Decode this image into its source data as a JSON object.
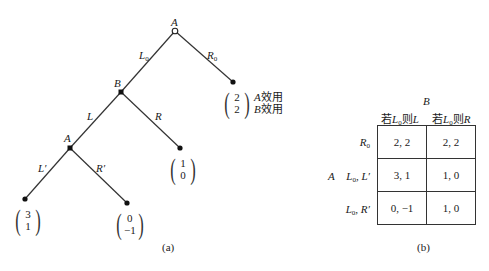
{
  "figure_a": {
    "caption": "(a)",
    "nodes": {
      "root": {
        "player": "A",
        "type": "open"
      },
      "b": {
        "player": "B"
      },
      "a2": {
        "player": "A"
      }
    },
    "edges": {
      "l0": {
        "label": "L",
        "sub": "0"
      },
      "r0": {
        "label": "R",
        "sub": "0"
      },
      "l": {
        "label": "L"
      },
      "r": {
        "label": "R"
      },
      "lp": {
        "label": "L′"
      },
      "rp": {
        "label": "R′"
      }
    },
    "payoffs": {
      "r0": {
        "a": "2",
        "b": "2"
      },
      "r": {
        "a": "1",
        "b": "0"
      },
      "lp": {
        "a": "3",
        "b": "1"
      },
      "rp": {
        "a": "0",
        "b": "−1"
      }
    },
    "legend": {
      "a_player": "A",
      "a_text": "效用",
      "b_player": "B",
      "b_text": "效用"
    }
  },
  "figure_b": {
    "caption": "(b)",
    "column_player": "B",
    "row_player": "A",
    "columns": [
      {
        "pre": "若",
        "cond": "L",
        "cond_sub": "0",
        "mid": "则",
        "act": "L"
      },
      {
        "pre": "若",
        "cond": "L",
        "cond_sub": "0",
        "mid": "则",
        "act": "R"
      }
    ],
    "rows": [
      {
        "label": "R",
        "sub": "0",
        "suffix": "",
        "cells": [
          "2, 2",
          "2, 2"
        ]
      },
      {
        "label": "L",
        "sub": "0",
        "suffix": ", L′",
        "cells": [
          "3, 1",
          "1, 0"
        ]
      },
      {
        "label": "L",
        "sub": "0",
        "suffix": ", R′",
        "cells": [
          "0, −1",
          "1, 0"
        ]
      }
    ]
  }
}
